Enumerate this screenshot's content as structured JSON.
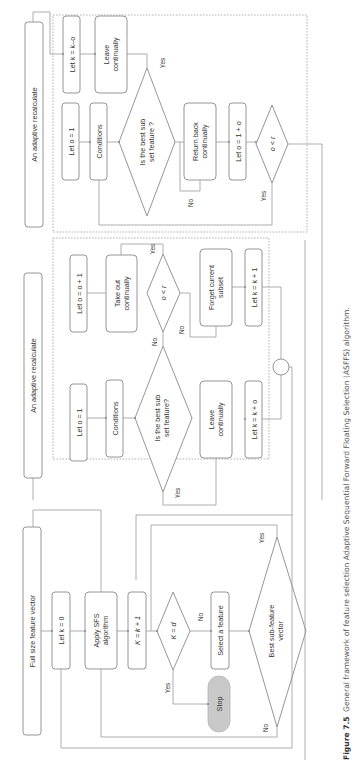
{
  "figure": {
    "caption_label": "Figure 7.5",
    "caption_text": "General framework of feature selection Adaptive Sequential Forward Floating Selection (ASFFS) algorithm.",
    "orientation": "rotated 90 degrees counter-clockwise"
  },
  "lanes": {
    "main": "Full size feature vector",
    "middle": "An adaptive recalculate",
    "top": "An adaptive recalculate"
  },
  "main_flow": {
    "init": "Let k = 0",
    "apply": [
      "Apply SFS",
      "algorithm"
    ],
    "increment": "K = k + 1",
    "decision": "K = d",
    "decision_yes": "Yes",
    "decision_no": "No",
    "stop": "Stop",
    "select": "Select a feature",
    "best": [
      "Best sub-feature",
      "vector"
    ],
    "best_yes": "Yes",
    "best_no": "No"
  },
  "middle_panel": {
    "init": "Let o = 1",
    "conditions": "Conditions",
    "decision": [
      "Is the best sub",
      "set feature?"
    ],
    "decision_yes": "Yes",
    "decision_no": "No",
    "leave": [
      "Leave",
      "continually"
    ],
    "k_update": "Let k = k + o",
    "take_out": [
      "Take out",
      "continually"
    ],
    "o_update": "Let o = o + 1",
    "loop_decision": "o < r",
    "loop_yes": "Yes",
    "loop_no": "No",
    "forget": [
      "Forget current",
      "subset"
    ],
    "k_plus_one": "Let k = k + 1"
  },
  "top_panel": {
    "init": "Let o = 1",
    "conditions": "Conditions",
    "decision": [
      "Is the best sub",
      "set feature ?"
    ],
    "decision_yes": "Yes",
    "decision_no": "No",
    "leave": [
      "Leave",
      "continually"
    ],
    "k_update": "Let k = k–o",
    "return_back": [
      "Return back",
      "continually"
    ],
    "o_update": "Let o = 1 + o",
    "loop_decision": "o < r",
    "loop_yes": "Yes"
  }
}
